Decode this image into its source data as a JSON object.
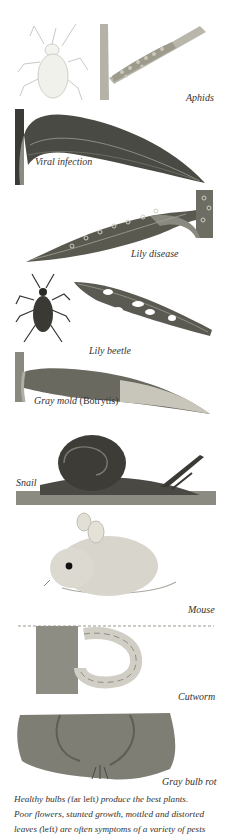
{
  "illustrations": [
    {
      "id": "aphids",
      "label": "Aphids"
    },
    {
      "id": "viral",
      "label": "Viral infection"
    },
    {
      "id": "lily_disease",
      "label": "Lily disease"
    },
    {
      "id": "lily_beetle",
      "label": "Lily beetle"
    },
    {
      "id": "gray_mold",
      "label": "Gray mold",
      "label_paren": "(Botrytis)"
    },
    {
      "id": "snail",
      "label": "Snail"
    },
    {
      "id": "mouse",
      "label": "Mouse"
    },
    {
      "id": "cutworm",
      "label": "Cutworm"
    },
    {
      "id": "bulb_rot",
      "label": "Gray bulb rot"
    }
  ],
  "caption": {
    "line1_a": "Healthy bulbs (",
    "line1_b": "far left",
    "line1_c": ") produce the best plants.",
    "line2": "Poor flowers, stunted growth, mottled and distorted",
    "line3_a": "leaves (",
    "line3_b": "left",
    "line3_c": ") are often symptoms of a variety of pests"
  }
}
